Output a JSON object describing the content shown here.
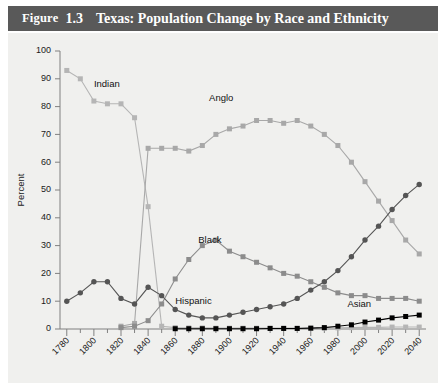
{
  "figure": {
    "label_word": "Figure",
    "number": "1.3",
    "title": "Texas: Population Change by Race and Ethnicity"
  },
  "chart_data": {
    "type": "line",
    "title": "Texas: Population Change by Race and Ethnicity",
    "xlabel": "",
    "ylabel": "Percent",
    "xlim": [
      1775,
      2045
    ],
    "ylim": [
      0,
      100
    ],
    "grid": false,
    "legend_position": "inline-annotations",
    "x_tick_labels": [
      "1780",
      "1800",
      "1820",
      "1840",
      "1860",
      "1880",
      "1900",
      "1920",
      "1940",
      "1960",
      "1980",
      "2000",
      "2020",
      "2040"
    ],
    "x_tick_values": [
      1780,
      1800,
      1820,
      1840,
      1860,
      1880,
      1900,
      1920,
      1940,
      1960,
      1980,
      2000,
      2020,
      2040
    ],
    "x_minor_tick_values": [
      1790,
      1810,
      1830,
      1850,
      1870,
      1890,
      1910,
      1930,
      1950,
      1970,
      1990,
      2010,
      2030
    ],
    "y_tick_values": [
      0,
      10,
      20,
      30,
      40,
      50,
      60,
      70,
      80,
      90,
      100
    ],
    "y_tick_labels": [
      "0",
      "10",
      "20",
      "30",
      "40",
      "50",
      "60",
      "70",
      "80",
      "90",
      "100"
    ],
    "series": [
      {
        "name": "Indian",
        "color": "#b5b5b5",
        "marker": "square",
        "label_x": 1800,
        "label_y": 87,
        "x": [
          1780,
          1790,
          1800,
          1810,
          1820,
          1830,
          1840,
          1850,
          1860,
          1870,
          1880,
          1890,
          1900,
          1910,
          1920,
          1930,
          1940,
          1950,
          1960,
          1970,
          1980,
          1990,
          2000,
          2010,
          2020,
          2030,
          2040
        ],
        "values": [
          93,
          90,
          82,
          81,
          81,
          76,
          44,
          1,
          0.5,
          0.4,
          0.4,
          0.3,
          0.3,
          0.3,
          0.3,
          0.3,
          0.3,
          0.3,
          0.3,
          0.3,
          0.4,
          0.5,
          0.6,
          0.6,
          0.7,
          0.7,
          0.7
        ]
      },
      {
        "name": "Anglo",
        "color": "#a8a8a8",
        "marker": "square",
        "label_x": 1885,
        "label_y": 82,
        "x": [
          1820,
          1830,
          1840,
          1850,
          1860,
          1870,
          1880,
          1890,
          1900,
          1910,
          1920,
          1930,
          1940,
          1950,
          1960,
          1970,
          1980,
          1990,
          2000,
          2010,
          2020,
          2030,
          2040
        ],
        "values": [
          1,
          2,
          65,
          65,
          65,
          64,
          66,
          70,
          72,
          73,
          75,
          75,
          74,
          75,
          73,
          70,
          66,
          60,
          53,
          46,
          39,
          32,
          27
        ]
      },
      {
        "name": "Black",
        "color": "#8c8c8c",
        "marker": "square",
        "label_x": 1877,
        "label_y": 31,
        "x": [
          1820,
          1830,
          1840,
          1850,
          1860,
          1870,
          1880,
          1890,
          1900,
          1910,
          1920,
          1930,
          1940,
          1950,
          1960,
          1970,
          1980,
          1990,
          2000,
          2010,
          2020,
          2030,
          2040
        ],
        "values": [
          0.5,
          1,
          3,
          9,
          18,
          25,
          30,
          32,
          28,
          26,
          24,
          22,
          20,
          19,
          17,
          15,
          13,
          12,
          12,
          11,
          11,
          11,
          10
        ]
      },
      {
        "name": "Hispanic",
        "color": "#555555",
        "marker": "circle",
        "label_x": 1860,
        "label_y": 9,
        "x": [
          1780,
          1790,
          1800,
          1810,
          1820,
          1830,
          1840,
          1850,
          1860,
          1870,
          1880,
          1890,
          1900,
          1910,
          1920,
          1930,
          1940,
          1950,
          1960,
          1970,
          1980,
          1990,
          2000,
          2010,
          2020,
          2030,
          2040
        ],
        "values": [
          10,
          13,
          17,
          17,
          11,
          9,
          15,
          12,
          7,
          5,
          4,
          4,
          5,
          6,
          7,
          8,
          9,
          11,
          14,
          17,
          21,
          26,
          32,
          37,
          43,
          48,
          52
        ]
      },
      {
        "name": "Asian",
        "color": "#000000",
        "marker": "square",
        "label_x": 1987,
        "label_y": 8,
        "x": [
          1860,
          1870,
          1880,
          1890,
          1900,
          1910,
          1920,
          1930,
          1940,
          1950,
          1960,
          1970,
          1980,
          1990,
          2000,
          2010,
          2020,
          2030,
          2040
        ],
        "values": [
          0.1,
          0.1,
          0.1,
          0.1,
          0.1,
          0.1,
          0.1,
          0.2,
          0.2,
          0.2,
          0.3,
          0.5,
          1,
          1.5,
          2.5,
          3.2,
          4,
          4.5,
          5
        ]
      }
    ]
  }
}
